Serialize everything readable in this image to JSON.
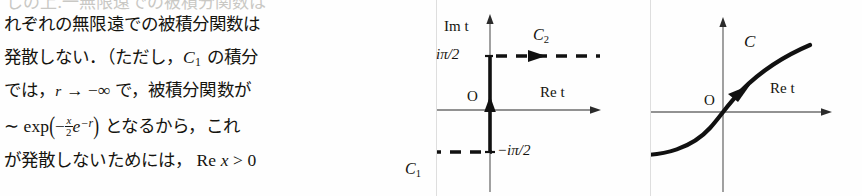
{
  "page": {
    "width": 862,
    "height": 196,
    "background": "#fefefe",
    "ink": "#15140f"
  },
  "body_text": {
    "cut_off_top_line": "しの上.一無限遠での被積分関数は",
    "lines": [
      {
        "id": "line1",
        "plain": "れぞれの無限遠での被積分関数は",
        "parts": [
          {
            "type": "jp",
            "text": "れぞれの無限遠での被積分関数は"
          }
        ]
      },
      {
        "id": "line2",
        "plain": "発散しない．（ただし，C₁ の積分",
        "parts": [
          {
            "type": "jp",
            "text": "発散しない．（ただし，"
          },
          {
            "type": "math-italic",
            "text": "C"
          },
          {
            "type": "math-sub",
            "text": "1"
          },
          {
            "type": "jp",
            "text": " の積分"
          }
        ]
      },
      {
        "id": "line3",
        "plain": "では，r → −∞ で，被積分関数が",
        "parts": [
          {
            "type": "jp",
            "text": "では，"
          },
          {
            "type": "math-italic",
            "text": "r"
          },
          {
            "type": "math-roman",
            "text": " → −∞ "
          },
          {
            "type": "jp",
            "text": "で，被積分関数が"
          }
        ]
      },
      {
        "id": "line4",
        "plain": "∼ exp(−(x/2)e^{−r}) となるから，これ",
        "parts": [
          {
            "type": "math-roman",
            "text": "∼ exp"
          },
          {
            "type": "paren",
            "text": "("
          },
          {
            "type": "math-roman",
            "text": "−"
          },
          {
            "type": "fraction",
            "num": "x",
            "den": "2"
          },
          {
            "type": "math-italic",
            "text": "e"
          },
          {
            "type": "math-sup",
            "text": "−r"
          },
          {
            "type": "paren",
            "text": ")"
          },
          {
            "type": "jp",
            "text": " となるから，これ"
          }
        ]
      },
      {
        "id": "line5",
        "plain": "が発散しないためには， Re x > 0",
        "parts": [
          {
            "type": "jp",
            "text": "が発散しないためには，"
          },
          {
            "type": "math-roman",
            "text": "  Re"
          },
          {
            "type": "math-italic",
            "text": " x"
          },
          {
            "type": "math-roman",
            "text": " > 0"
          }
        ]
      }
    ]
  },
  "figures": [
    {
      "id": "figure-left",
      "name": "contour-diagram-c1-c2",
      "description": "Complex t-plane with vertical segment from -iπ/2 to +iπ/2 and two horizontal dashed contours C1 and C2",
      "axis_labels": {
        "vertical": "Im t",
        "horizontal": "Re t",
        "origin": "O"
      },
      "tick_labels": {
        "upper": "iπ/2",
        "lower": "−iπ/2"
      },
      "contours": [
        {
          "label": "C",
          "subscript": "2",
          "style": "dashed",
          "direction": "rightward",
          "level": "iπ/2"
        },
        {
          "label": "C",
          "subscript": "1",
          "style": "dashed",
          "direction": "rightward",
          "level": "−iπ/2"
        }
      ],
      "connecting_segment": {
        "style": "solid-thick",
        "direction": "upward"
      }
    },
    {
      "id": "figure-right",
      "name": "contour-diagram-c",
      "description": "Complex t-plane with a single deformed sigmoid contour C passing through the origin, oriented rightward",
      "axis_labels": {
        "vertical": "",
        "horizontal": "Re t",
        "origin": "O"
      },
      "contours": [
        {
          "label": "C",
          "subscript": "",
          "style": "solid-thick",
          "direction": "rightward"
        }
      ]
    }
  ],
  "colors": {
    "ink": "#15140f",
    "axis": "#6e6e6e",
    "curve": "#111111",
    "panel_rule": "#dedede",
    "faded_text": "#c9c8c4"
  }
}
